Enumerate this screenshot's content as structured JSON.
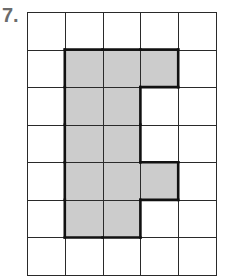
{
  "problem_label": "7.",
  "grid": {
    "rows": 7,
    "cols": 5,
    "shaded_color": "#cccccc",
    "line_color": "#2a2a2a",
    "shaded_cells": [
      [
        1,
        1
      ],
      [
        1,
        2
      ],
      [
        1,
        3
      ],
      [
        2,
        1
      ],
      [
        2,
        2
      ],
      [
        3,
        1
      ],
      [
        3,
        2
      ],
      [
        4,
        1
      ],
      [
        4,
        2
      ],
      [
        4,
        3
      ],
      [
        5,
        1
      ],
      [
        5,
        2
      ]
    ]
  }
}
